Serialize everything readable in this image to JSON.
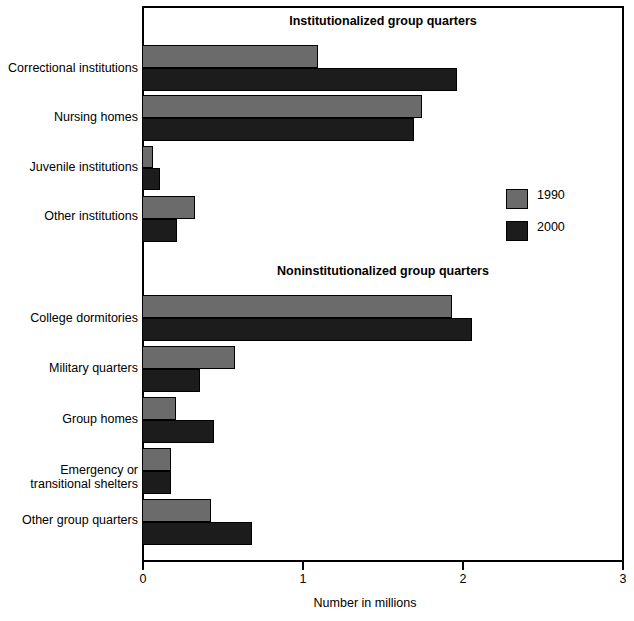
{
  "chart_data": {
    "type": "bar",
    "orientation": "horizontal",
    "title": "",
    "xlabel": "Number in millions",
    "ylabel": "",
    "xlim": [
      0,
      3
    ],
    "xticks": [
      "0",
      "1",
      "2",
      "3"
    ],
    "grid": false,
    "legend_position": "right-upper",
    "categories": [
      "Correctional institutions",
      "Nursing homes",
      "Juvenile institutions",
      "Other institutions",
      "College dormitories",
      "Military quarters",
      "Group homes",
      "Emergency or\ntransitional shelters",
      "Other group quarters"
    ],
    "series": [
      {
        "name": "1990",
        "color": "#6b6b6b",
        "values": [
          1.1,
          1.75,
          0.07,
          0.33,
          1.94,
          0.58,
          0.21,
          0.18,
          0.43
        ]
      },
      {
        "name": "2000",
        "color": "#1c1c1c",
        "values": [
          1.97,
          1.7,
          0.11,
          0.22,
          2.06,
          0.36,
          0.45,
          0.18,
          0.69
        ]
      }
    ],
    "group_headers": [
      {
        "label": "Institutionalized group quarters",
        "covers": [
          0,
          1,
          2,
          3
        ]
      },
      {
        "label": "Noninstitutionalized group quarters",
        "covers": [
          4,
          5,
          6,
          7,
          8
        ]
      }
    ]
  },
  "legend": {
    "entries": [
      {
        "label": "1990",
        "color": "#6b6b6b"
      },
      {
        "label": "2000",
        "color": "#1c1c1c"
      }
    ]
  },
  "axis": {
    "x_title": "Number in millions",
    "ticks": [
      {
        "label": "0",
        "value": 0
      },
      {
        "label": "1",
        "value": 1
      },
      {
        "label": "2",
        "value": 2
      },
      {
        "label": "3",
        "value": 3
      }
    ]
  },
  "headers": {
    "institutionalized": "Institutionalized group quarters",
    "noninstitutionalized": "Noninstitutionalized group quarters"
  },
  "labels": {
    "correctional": "Correctional institutions",
    "nursing": "Nursing homes",
    "juvenile": "Juvenile institutions",
    "other_inst": "Other institutions",
    "college": "College dormitories",
    "military": "Military quarters",
    "group_homes": "Group homes",
    "shelters": "Emergency or\ntransitional shelters",
    "other_gq": "Other group quarters"
  },
  "colors": {
    "series_1990": "#6b6b6b",
    "series_2000": "#1c1c1c",
    "axis": "#000000",
    "background": "#ffffff"
  }
}
